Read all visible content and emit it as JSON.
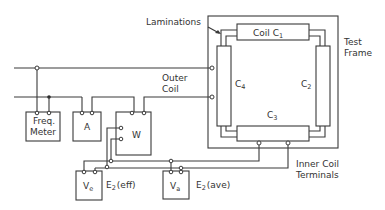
{
  "diagram": {
    "title": "",
    "labels": {
      "laminations": "Laminations",
      "test_frame_line1": "Test",
      "test_frame_line2": "Frame",
      "outer_coil_line1": "Outer",
      "outer_coil_line2": "Coil",
      "inner_coil_line1": "Inner Coil",
      "inner_coil_line2": "Terminals"
    },
    "coils": {
      "c1_prefix": "Coil C",
      "c1_sub": "1",
      "c2": "C",
      "c2_sub": "2",
      "c3": "C",
      "c3_sub": "3",
      "c4": "C",
      "c4_sub": "4"
    },
    "instruments": {
      "freq_line1": "Freq.",
      "freq_line2": "Meter",
      "ammeter": "A",
      "wattmeter": "W",
      "ve": "V",
      "ve_sub": "e",
      "va": "V",
      "va_sub": "a"
    },
    "readings": {
      "e2_eff_prefix": "E",
      "e2_eff_sub": "2",
      "e2_eff_suffix": "(eff)",
      "e2_ave_prefix": "E",
      "e2_ave_sub": "2",
      "e2_ave_suffix": "(ave)"
    }
  }
}
